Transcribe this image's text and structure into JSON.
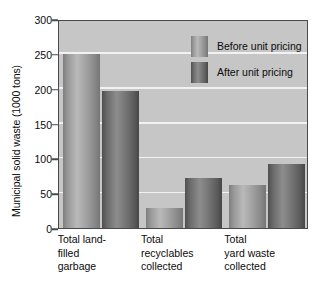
{
  "chart_data": {
    "type": "bar",
    "title": "",
    "xlabel": "",
    "ylabel": "Municipal solid waste (1000 tons)",
    "categories": [
      "Total land-\nfilled\ngarbage",
      "Total\nrecyclables\ncollected",
      "Total\nyard waste\ncollected"
    ],
    "category_lines": [
      [
        "Total land-",
        "filled",
        "garbage"
      ],
      [
        "Total",
        "recyclables",
        "collected"
      ],
      [
        "Total",
        "yard waste",
        "collected"
      ]
    ],
    "series": [
      {
        "name": "Before unit pricing",
        "color": "#a2a2a2",
        "values": [
          250,
          29,
          62
        ]
      },
      {
        "name": "After unit pricing",
        "color": "#6b6b6b",
        "values": [
          196,
          72,
          92
        ]
      }
    ],
    "ylim": [
      0,
      300
    ],
    "yticks": [
      0,
      50,
      100,
      150,
      200,
      250,
      300
    ],
    "ytick_labels": [
      "0",
      "50",
      "100",
      "150",
      "200",
      "250",
      "300"
    ],
    "grid": true,
    "grid_color": "#f2f2f2",
    "legend_position": "top-right-inside",
    "plot_background": "#c6c6c6",
    "frame_color": "#4a4a4a"
  },
  "legend": {
    "items": [
      {
        "label": "Before unit pricing"
      },
      {
        "label": "After unit pricing"
      }
    ]
  }
}
